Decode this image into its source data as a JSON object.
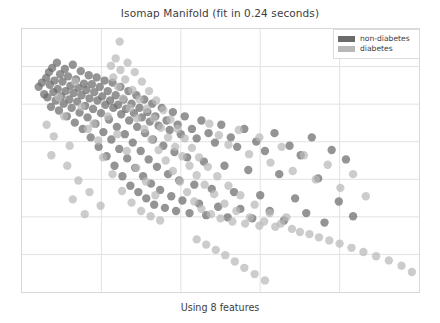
{
  "figure": {
    "title": "Isomap Manifold (fit in 0.24 seconds)",
    "x_caption": "Using 8 features"
  },
  "legend": {
    "entries": [
      {
        "label": "non-diabetes",
        "color": "#6b6b6b"
      },
      {
        "label": "diabetes",
        "color": "#b8b8b8"
      }
    ]
  },
  "chart_data": {
    "type": "scatter",
    "title": "Isomap Manifold (fit in 0.24 seconds)",
    "xlabel": "Using 8 features",
    "ylabel": "",
    "grid": true,
    "legend_position": "upper right",
    "axis_ticks_visible": false,
    "xlim": [
      0,
      100
    ],
    "ylim": [
      0,
      100
    ],
    "marker_radius_px": 4.2,
    "marker_opacity": 0.72,
    "series": [
      {
        "name": "non-diabetes",
        "color": "#6b6b6b",
        "points": [
          [
            4.2,
            22.0
          ],
          [
            5.0,
            20.4
          ],
          [
            5.6,
            24.8
          ],
          [
            6.1,
            18.6
          ],
          [
            6.4,
            26.0
          ],
          [
            6.8,
            16.4
          ],
          [
            7.0,
            21.2
          ],
          [
            7.3,
            29.6
          ],
          [
            7.6,
            14.8
          ],
          [
            7.9,
            24.0
          ],
          [
            8.2,
            19.6
          ],
          [
            8.5,
            27.2
          ],
          [
            8.8,
            12.8
          ],
          [
            9.0,
            22.8
          ],
          [
            9.3,
            31.0
          ],
          [
            9.6,
            17.2
          ],
          [
            9.9,
            25.6
          ],
          [
            10.2,
            20.0
          ],
          [
            10.5,
            28.4
          ],
          [
            10.8,
            15.2
          ],
          [
            11.0,
            23.6
          ],
          [
            11.3,
            33.2
          ],
          [
            11.6,
            18.0
          ],
          [
            11.9,
            26.8
          ],
          [
            12.2,
            21.6
          ],
          [
            12.5,
            30.0
          ],
          [
            12.8,
            13.6
          ],
          [
            13.0,
            24.4
          ],
          [
            13.3,
            35.6
          ],
          [
            13.6,
            19.2
          ],
          [
            13.9,
            27.6
          ],
          [
            14.2,
            22.4
          ],
          [
            14.5,
            31.8
          ],
          [
            14.8,
            16.0
          ],
          [
            15.0,
            25.2
          ],
          [
            15.3,
            38.0
          ],
          [
            15.6,
            20.8
          ],
          [
            15.9,
            29.2
          ],
          [
            16.2,
            23.2
          ],
          [
            16.5,
            33.6
          ],
          [
            16.8,
            17.6
          ],
          [
            17.0,
            26.4
          ],
          [
            17.3,
            41.2
          ],
          [
            17.6,
            21.0
          ],
          [
            17.9,
            30.4
          ],
          [
            18.2,
            24.0
          ],
          [
            18.5,
            36.0
          ],
          [
            18.8,
            18.4
          ],
          [
            19.0,
            27.2
          ],
          [
            19.3,
            44.8
          ],
          [
            19.6,
            22.0
          ],
          [
            19.9,
            32.0
          ],
          [
            20.2,
            25.6
          ],
          [
            20.5,
            39.2
          ],
          [
            20.8,
            19.6
          ],
          [
            21.0,
            28.8
          ],
          [
            21.3,
            48.4
          ],
          [
            21.6,
            23.6
          ],
          [
            21.9,
            34.4
          ],
          [
            22.2,
            27.2
          ],
          [
            22.5,
            42.0
          ],
          [
            22.8,
            20.4
          ],
          [
            23.0,
            30.0
          ],
          [
            23.3,
            52.0
          ],
          [
            23.6,
            25.2
          ],
          [
            23.9,
            37.2
          ],
          [
            24.2,
            28.8
          ],
          [
            24.5,
            45.6
          ],
          [
            24.8,
            22.0
          ],
          [
            25.0,
            32.4
          ],
          [
            25.3,
            56.0
          ],
          [
            25.6,
            26.8
          ],
          [
            25.9,
            40.0
          ],
          [
            26.2,
            30.4
          ],
          [
            26.5,
            49.2
          ],
          [
            26.8,
            23.6
          ],
          [
            27.0,
            34.8
          ],
          [
            27.3,
            59.6
          ],
          [
            27.6,
            28.4
          ],
          [
            27.9,
            43.2
          ],
          [
            28.2,
            32.0
          ],
          [
            28.5,
            52.8
          ],
          [
            28.8,
            25.2
          ],
          [
            29.0,
            37.2
          ],
          [
            29.3,
            62.0
          ],
          [
            29.6,
            30.0
          ],
          [
            29.9,
            46.4
          ],
          [
            30.2,
            33.6
          ],
          [
            30.5,
            56.0
          ],
          [
            30.8,
            26.8
          ],
          [
            31.0,
            39.6
          ],
          [
            31.3,
            64.4
          ],
          [
            31.6,
            31.6
          ],
          [
            31.9,
            49.6
          ],
          [
            32.2,
            35.2
          ],
          [
            32.5,
            58.8
          ],
          [
            32.8,
            28.4
          ],
          [
            33.0,
            42.0
          ],
          [
            33.3,
            66.8
          ],
          [
            33.6,
            33.2
          ],
          [
            34.0,
            52.4
          ],
          [
            34.4,
            36.8
          ],
          [
            34.8,
            61.2
          ],
          [
            35.2,
            30.0
          ],
          [
            35.6,
            44.4
          ],
          [
            36.0,
            68.0
          ],
          [
            36.4,
            34.8
          ],
          [
            36.8,
            55.2
          ],
          [
            37.2,
            38.4
          ],
          [
            37.6,
            63.6
          ],
          [
            38.0,
            31.6
          ],
          [
            38.4,
            46.8
          ],
          [
            38.8,
            69.2
          ],
          [
            39.2,
            36.4
          ],
          [
            39.6,
            57.6
          ],
          [
            40.0,
            40.0
          ],
          [
            40.4,
            65.2
          ],
          [
            41.0,
            33.2
          ],
          [
            41.6,
            48.8
          ],
          [
            42.2,
            70.0
          ],
          [
            42.8,
            38.0
          ],
          [
            43.4,
            59.2
          ],
          [
            44.0,
            41.6
          ],
          [
            44.6,
            66.4
          ],
          [
            45.2,
            34.8
          ],
          [
            45.8,
            50.4
          ],
          [
            46.4,
            70.8
          ],
          [
            47.0,
            39.6
          ],
          [
            47.8,
            60.8
          ],
          [
            48.6,
            43.2
          ],
          [
            49.4,
            67.6
          ],
          [
            50.2,
            36.4
          ],
          [
            51.0,
            52.0
          ],
          [
            51.8,
            71.6
          ],
          [
            52.6,
            41.2
          ],
          [
            53.4,
            62.0
          ],
          [
            54.2,
            44.8
          ],
          [
            55.0,
            68.4
          ],
          [
            56.0,
            38.0
          ],
          [
            57.0,
            53.6
          ],
          [
            58.0,
            72.0
          ],
          [
            59.0,
            42.8
          ],
          [
            60.0,
            63.2
          ],
          [
            61.2,
            46.4
          ],
          [
            62.4,
            69.2
          ],
          [
            63.6,
            39.6
          ],
          [
            64.8,
            55.2
          ],
          [
            66.0,
            72.8
          ],
          [
            67.4,
            44.4
          ],
          [
            68.8,
            64.4
          ],
          [
            70.2,
            48.0
          ],
          [
            71.6,
            70.0
          ],
          [
            73.0,
            41.2
          ],
          [
            74.6,
            56.8
          ],
          [
            76.2,
            73.6
          ],
          [
            78.0,
            46.0
          ],
          [
            79.8,
            65.6
          ],
          [
            81.6,
            49.6
          ],
          [
            83.4,
            71.2
          ]
        ]
      },
      {
        "name": "diabetes",
        "color": "#b8b8b8",
        "points": [
          [
            24.6,
            4.8
          ],
          [
            22.4,
            14.0
          ],
          [
            23.0,
            18.4
          ],
          [
            23.6,
            11.2
          ],
          [
            24.2,
            22.0
          ],
          [
            24.8,
            15.6
          ],
          [
            25.4,
            26.4
          ],
          [
            26.0,
            19.2
          ],
          [
            26.6,
            12.8
          ],
          [
            27.2,
            30.0
          ],
          [
            27.8,
            23.2
          ],
          [
            28.4,
            16.4
          ],
          [
            29.0,
            34.0
          ],
          [
            29.6,
            26.8
          ],
          [
            30.2,
            20.0
          ],
          [
            30.8,
            38.0
          ],
          [
            31.4,
            30.4
          ],
          [
            32.0,
            23.6
          ],
          [
            32.6,
            42.0
          ],
          [
            33.2,
            34.0
          ],
          [
            33.8,
            27.2
          ],
          [
            34.4,
            46.0
          ],
          [
            35.0,
            37.6
          ],
          [
            35.6,
            30.8
          ],
          [
            36.2,
            50.0
          ],
          [
            36.8,
            41.2
          ],
          [
            37.4,
            34.4
          ],
          [
            38.0,
            54.0
          ],
          [
            38.6,
            44.8
          ],
          [
            39.2,
            38.0
          ],
          [
            39.8,
            58.0
          ],
          [
            40.4,
            48.4
          ],
          [
            41.0,
            41.6
          ],
          [
            41.6,
            62.0
          ],
          [
            42.2,
            52.0
          ],
          [
            42.8,
            45.2
          ],
          [
            43.4,
            65.6
          ],
          [
            44.0,
            55.6
          ],
          [
            44.6,
            48.8
          ],
          [
            45.2,
            68.4
          ],
          [
            46.0,
            59.2
          ],
          [
            46.8,
            52.4
          ],
          [
            47.6,
            70.4
          ],
          [
            48.4,
            62.8
          ],
          [
            49.2,
            56.0
          ],
          [
            50.0,
            72.0
          ],
          [
            51.0,
            66.4
          ],
          [
            52.0,
            59.6
          ],
          [
            53.0,
            73.2
          ],
          [
            54.0,
            69.2
          ],
          [
            55.0,
            63.2
          ],
          [
            56.2,
            74.0
          ],
          [
            57.4,
            71.6
          ],
          [
            58.6,
            66.8
          ],
          [
            59.8,
            74.8
          ],
          [
            61.0,
            73.2
          ],
          [
            62.4,
            70.0
          ],
          [
            63.8,
            75.2
          ],
          [
            65.2,
            74.0
          ],
          [
            66.6,
            71.6
          ],
          [
            18.0,
            36.0
          ],
          [
            19.2,
            42.4
          ],
          [
            20.4,
            48.8
          ],
          [
            21.6,
            33.2
          ],
          [
            22.8,
            55.2
          ],
          [
            24.0,
            40.0
          ],
          [
            25.2,
            61.6
          ],
          [
            26.4,
            46.4
          ],
          [
            27.6,
            66.0
          ],
          [
            28.8,
            52.8
          ],
          [
            30.0,
            69.2
          ],
          [
            31.2,
            58.0
          ],
          [
            32.4,
            71.2
          ],
          [
            33.6,
            63.2
          ],
          [
            34.8,
            72.8
          ],
          [
            13.4,
            20.0
          ],
          [
            15.0,
            29.6
          ],
          [
            16.6,
            38.0
          ],
          [
            12.0,
            44.4
          ],
          [
            10.6,
            33.2
          ],
          [
            9.2,
            26.0
          ],
          [
            8.0,
            40.8
          ],
          [
            11.4,
            52.0
          ],
          [
            14.2,
            57.6
          ],
          [
            17.0,
            62.0
          ],
          [
            19.8,
            67.2
          ],
          [
            7.4,
            48.0
          ],
          [
            6.2,
            36.4
          ],
          [
            12.8,
            64.8
          ],
          [
            15.8,
            70.4
          ],
          [
            47.2,
            36.0
          ],
          [
            49.6,
            40.4
          ],
          [
            52.0,
            44.0
          ],
          [
            54.6,
            38.4
          ],
          [
            57.2,
            47.6
          ],
          [
            59.8,
            41.2
          ],
          [
            62.6,
            50.8
          ],
          [
            65.4,
            44.8
          ],
          [
            68.2,
            54.0
          ],
          [
            71.0,
            48.0
          ],
          [
            74.0,
            57.2
          ],
          [
            77.0,
            51.6
          ],
          [
            80.2,
            60.4
          ],
          [
            83.4,
            55.2
          ],
          [
            86.6,
            63.6
          ],
          [
            68.0,
            76.0
          ],
          [
            70.0,
            77.2
          ],
          [
            72.4,
            78.0
          ],
          [
            74.8,
            79.2
          ],
          [
            77.4,
            80.4
          ],
          [
            80.0,
            81.6
          ],
          [
            83.0,
            83.2
          ],
          [
            86.0,
            84.8
          ],
          [
            89.2,
            86.4
          ],
          [
            92.4,
            88.0
          ],
          [
            95.6,
            90.0
          ],
          [
            98.2,
            92.4
          ],
          [
            44.0,
            80.0
          ],
          [
            46.4,
            82.0
          ],
          [
            48.8,
            84.0
          ],
          [
            51.2,
            86.0
          ],
          [
            53.6,
            88.4
          ],
          [
            56.0,
            90.8
          ],
          [
            58.6,
            93.2
          ],
          [
            61.2,
            95.6
          ]
        ]
      }
    ],
    "annotations": [
      {
        "label": "outlier-top",
        "x": 24.6,
        "y": 4.8,
        "series": "diabetes"
      }
    ]
  }
}
